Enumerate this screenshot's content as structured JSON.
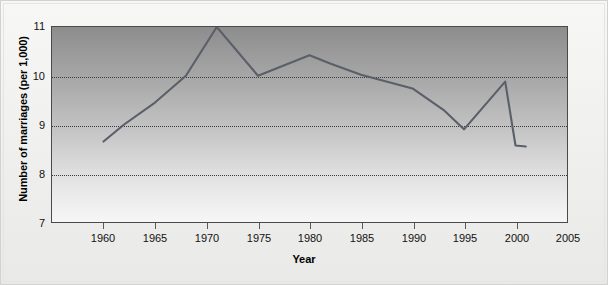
{
  "chart_data": {
    "type": "line",
    "title": "",
    "xlabel": "Year",
    "ylabel": "Number of marriages (per 1,000)",
    "xlim": [
      1955,
      2005
    ],
    "ylim": [
      7,
      11
    ],
    "xticks": [
      1960,
      1965,
      1970,
      1975,
      1980,
      1985,
      1990,
      1995,
      2000,
      2005
    ],
    "yticks": [
      7,
      8,
      9,
      10,
      11
    ],
    "gridlines_y": [
      8,
      9,
      10
    ],
    "grid": true,
    "legend": null,
    "series": [
      {
        "name": "Marriage rate",
        "color": "#5a5f68",
        "x": [
          1960,
          1962,
          1965,
          1968,
          1971,
          1975,
          1980,
          1982,
          1985,
          1988,
          1990,
          1993,
          1995,
          1999,
          2000,
          2001
        ],
        "values": [
          8.65,
          9.0,
          9.45,
          10.0,
          11.0,
          10.0,
          10.42,
          10.25,
          10.02,
          9.85,
          9.74,
          9.3,
          8.9,
          9.88,
          8.57,
          8.55
        ]
      }
    ]
  },
  "axes": {
    "y_tick_labels": [
      "11",
      "10",
      "9",
      "8",
      "7"
    ],
    "x_tick_labels": [
      "1960",
      "1965",
      "1970",
      "1975",
      "1980",
      "1985",
      "1990",
      "1995",
      "2000",
      "2005"
    ],
    "x_axis_title": "Year",
    "y_axis_title": "Number of marriages (per 1,000)"
  },
  "colors": {
    "line": "#5a5f68",
    "plot_border": "#4a4a4a",
    "gridline": "#3a3a3a",
    "page_background": "#f2f2f0"
  }
}
